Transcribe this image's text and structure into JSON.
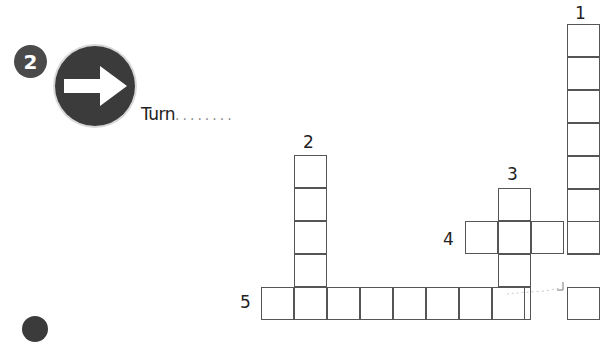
{
  "exercise": {
    "number": "2",
    "sign_icon": "arrow-right-sign-icon",
    "prompt": "Turn",
    "blank": "........"
  },
  "crossword": {
    "clue_numbers": [
      "1",
      "2",
      "3",
      "4",
      "5"
    ],
    "cell_size": 33,
    "words": [
      {
        "number": "1",
        "direction": "down",
        "length": 8,
        "start": {
          "x": 567,
          "y": 24
        }
      },
      {
        "number": "2",
        "direction": "down",
        "length": 5,
        "start": {
          "x": 294,
          "y": 155
        }
      },
      {
        "number": "3",
        "direction": "down",
        "length": 4,
        "start": {
          "x": 498,
          "y": 188
        }
      },
      {
        "number": "4",
        "direction": "across",
        "length": 4,
        "start": {
          "x": 465,
          "y": 221
        }
      },
      {
        "number": "5",
        "direction": "across",
        "length": 8,
        "start": {
          "x": 261,
          "y": 287
        }
      }
    ]
  },
  "colors": {
    "sign": "#3b3b3b",
    "badge": "#4a4a4a",
    "grid_line": "#555555"
  }
}
